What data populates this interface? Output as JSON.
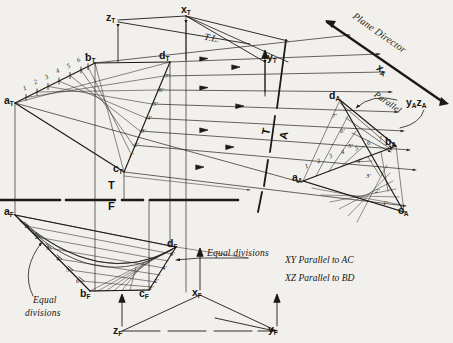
{
  "drawing": {
    "title": "Hyperbolic Paraboloid - Descriptive Geometry Construction",
    "background_color": "#f2f0ec",
    "line_color": "#1b1916",
    "accent_color": "#a83a3a"
  },
  "reference_lines": {
    "tf": {
      "top_label": "T",
      "bottom_label": "F"
    },
    "ta": {
      "left_label": "T",
      "right_label": "A"
    }
  },
  "top_view": {
    "points": [
      {
        "name": "a-sub-T",
        "label": "a",
        "sub": "T",
        "x": 8,
        "y": 94
      },
      {
        "name": "b-sub-T",
        "label": "b",
        "sub": "T",
        "x": 89,
        "y": 54
      },
      {
        "name": "d-sub-T",
        "label": "d",
        "sub": "T",
        "x": 163,
        "y": 53
      },
      {
        "name": "c-sub-T",
        "label": "c",
        "sub": "T",
        "x": 117,
        "y": 163
      },
      {
        "name": "z-sub-T",
        "label": "z",
        "sub": "T",
        "x": 111,
        "y": 14
      },
      {
        "name": "x-sub-T",
        "label": "x",
        "sub": "T",
        "x": 186,
        "y": 8
      },
      {
        "name": "y-sub-T",
        "label": "y",
        "sub": "T",
        "x": 271,
        "y": 58
      }
    ],
    "divisions_ab": [
      "1",
      "2",
      "3",
      "4",
      "5",
      "6",
      "7"
    ],
    "divisions_dc": [
      "7'",
      "6'",
      "5'",
      "4'",
      "3'",
      "2'",
      "1'"
    ],
    "true_length_label": "T.L."
  },
  "front_view": {
    "points": [
      {
        "name": "a-sub-F",
        "label": "a",
        "sub": "F",
        "x": 8,
        "y": 209
      },
      {
        "name": "b-sub-F",
        "label": "b",
        "sub": "F",
        "x": 83,
        "y": 288
      },
      {
        "name": "c-sub-F",
        "label": "c",
        "sub": "F",
        "x": 142,
        "y": 288
      },
      {
        "name": "d-sub-F",
        "label": "d",
        "sub": "F",
        "x": 169,
        "y": 241
      },
      {
        "name": "z-sub-F",
        "label": "z",
        "sub": "F",
        "x": 118,
        "y": 326
      },
      {
        "name": "x-sub-F",
        "label": "x",
        "sub": "F",
        "x": 196,
        "y": 289
      },
      {
        "name": "y-sub-F",
        "label": "y",
        "sub": "F",
        "x": 270,
        "y": 326
      }
    ],
    "divisions_ab": [
      "1",
      "2",
      "3",
      "4",
      "5",
      "6"
    ],
    "divisions_dc": [
      "6'",
      "4'",
      "2'",
      "1'"
    ]
  },
  "auxiliary_view": {
    "points": [
      {
        "name": "a-sub-A",
        "label": "a",
        "sub": "A",
        "x": 296,
        "y": 175
      },
      {
        "name": "b-sub-A",
        "label": "b",
        "sub": "A",
        "x": 389,
        "y": 140
      },
      {
        "name": "c-sub-A",
        "label": "c",
        "sub": "A",
        "x": 401,
        "y": 208
      },
      {
        "name": "d-sub-A",
        "label": "d",
        "sub": "A",
        "x": 333,
        "y": 93
      },
      {
        "name": "x-sub-A",
        "label": "x",
        "sub": "A",
        "x": 380,
        "y": 68
      },
      {
        "name": "yz-sub-A",
        "label": "y",
        "sub": "A",
        "label2": "z",
        "sub2": "A",
        "x": 411,
        "y": 100
      }
    ],
    "divisions_ab": [
      "1",
      "2",
      "3",
      "4",
      "5",
      "6",
      "7"
    ],
    "divisions_dc": [
      "7'",
      "6'",
      "5'",
      "4'",
      "3'",
      "2'",
      "1'"
    ]
  },
  "annotations": {
    "plane_director": "Plane Director",
    "parallel": "Parallel",
    "equal_divisions_left": "Equal",
    "equal_divisions_left2": "divisions",
    "equal_divisions_right": "Equal divisions",
    "note_1": "XY Parallel to AC",
    "note_2": "XZ Parallel to BD",
    "true_length": "T.L."
  }
}
